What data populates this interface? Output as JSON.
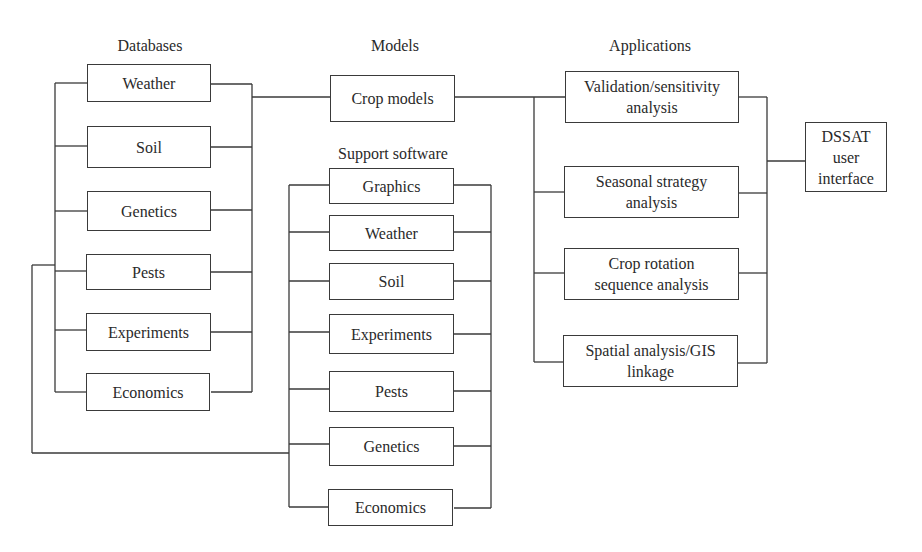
{
  "headers": {
    "databases": "Databases",
    "models": "Models",
    "support_software": "Support software",
    "applications": "Applications"
  },
  "databases": [
    "Weather",
    "Soil",
    "Genetics",
    "Pests",
    "Experiments",
    "Economics"
  ],
  "models": {
    "crop_models": "Crop models"
  },
  "support_software": [
    "Graphics",
    "Weather",
    "Soil",
    "Experiments",
    "Pests",
    "Genetics",
    "Economics"
  ],
  "applications": [
    "Validation/sensitivity\nanalysis",
    "Seasonal strategy\nanalysis",
    "Crop rotation\nsequence analysis",
    "Spatial analysis/GIS\nlinkage"
  ],
  "interface": {
    "dssat": "DSSAT\nuser\ninterface"
  }
}
